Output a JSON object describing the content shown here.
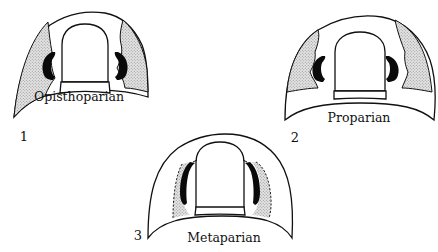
{
  "figure": {
    "stipple_color": "#c9c9c9",
    "line_color": "#111111",
    "eye_color": "#0a0a0a",
    "panels": [
      {
        "number": "1",
        "label": "Opisthoparian"
      },
      {
        "number": "2",
        "label": "Proparian"
      },
      {
        "number": "3",
        "label": "Metaparian"
      }
    ]
  }
}
